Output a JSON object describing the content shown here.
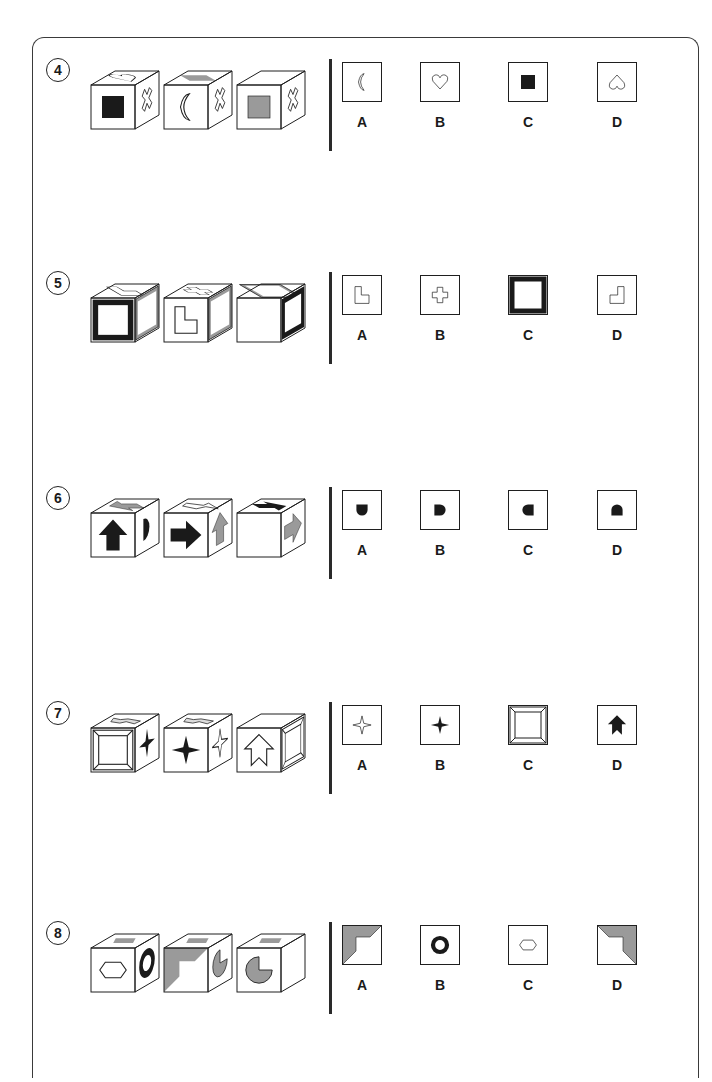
{
  "colors": {
    "ink": "#1f1f1f",
    "gray": "#9a9a9a",
    "black": "#1a1a1a",
    "frame": "#3a3a3a"
  },
  "puzzles": [
    {
      "number": "4",
      "top": 62,
      "cubes": [
        {
          "front": "solid-square-black",
          "top": "heart-outline",
          "right": "cross-outline-rotated"
        },
        {
          "front": "crescent-moon-outline",
          "top": "square-gray",
          "right": "cross-outline-rotated"
        },
        {
          "front": "solid-square-gray",
          "top": "blank",
          "right": "cross-outline-rotated"
        }
      ],
      "options": [
        {
          "label": "A",
          "symbol": "crescent-moon-outline"
        },
        {
          "label": "B",
          "symbol": "heart-outline"
        },
        {
          "label": "C",
          "symbol": "solid-square-black"
        },
        {
          "label": "D",
          "symbol": "heart-outline-inverted"
        }
      ]
    },
    {
      "number": "5",
      "top": 275,
      "cubes": [
        {
          "front": "thick-black-border",
          "top": "l-shape-outline",
          "right": "gray-border"
        },
        {
          "front": "l-shape-outline",
          "top": "plus-outline",
          "right": "gray-border"
        },
        {
          "front": "blank",
          "top": "gray-border",
          "right": "thick-black-border"
        }
      ],
      "options": [
        {
          "label": "A",
          "symbol": "l-shape-outline"
        },
        {
          "label": "B",
          "symbol": "plus-outline"
        },
        {
          "label": "C",
          "symbol": "thick-black-border"
        },
        {
          "label": "D",
          "symbol": "l-shape-outline-rotated"
        }
      ]
    },
    {
      "number": "6",
      "top": 490,
      "cubes": [
        {
          "front": "arrow-up-black",
          "top": "arrow-left-gray",
          "right": "half-disc-black"
        },
        {
          "front": "arrow-right-black",
          "top": "arrow-split-outline",
          "right": "arrow-up-gray"
        },
        {
          "front": "blank",
          "top": "arrow-right-black",
          "right": "arrow-right-gray"
        }
      ],
      "options": [
        {
          "label": "A",
          "symbol": "half-disc-down"
        },
        {
          "label": "B",
          "symbol": "half-disc-right"
        },
        {
          "label": "C",
          "symbol": "half-disc-left"
        },
        {
          "label": "D",
          "symbol": "half-disc-up"
        }
      ]
    },
    {
      "number": "7",
      "top": 705,
      "cubes": [
        {
          "front": "bevel-frame",
          "top": "chevron-arrow-outline",
          "right": "star4-black"
        },
        {
          "front": "star4-black",
          "top": "chevron-arrow-outline",
          "right": "star4-outline"
        },
        {
          "front": "chevron-arrow-up-outline",
          "top": "blank",
          "right": "bevel-frame"
        }
      ],
      "options": [
        {
          "label": "A",
          "symbol": "star4-outline"
        },
        {
          "label": "B",
          "symbol": "star4-black"
        },
        {
          "label": "C",
          "symbol": "bevel-frame"
        },
        {
          "label": "D",
          "symbol": "chevron-arrow-up-black"
        }
      ]
    },
    {
      "number": "8",
      "top": 925,
      "cubes": [
        {
          "front": "hexagon-outline",
          "top": "parallelogram-gray",
          "right": "ring-black"
        },
        {
          "front": "corner-gray-l",
          "top": "parallelogram-gray",
          "right": "pacman-gray"
        },
        {
          "front": "pacman-gray",
          "top": "parallelogram-gray",
          "right": "blank"
        }
      ],
      "options": [
        {
          "label": "A",
          "symbol": "corner-gray-l"
        },
        {
          "label": "B",
          "symbol": "ring-black"
        },
        {
          "label": "C",
          "symbol": "hexagon-outline"
        },
        {
          "label": "D",
          "symbol": "corner-gray-l-mirrored"
        }
      ]
    }
  ]
}
